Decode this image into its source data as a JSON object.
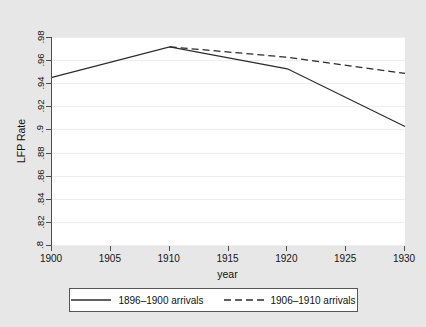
{
  "chart_data": {
    "type": "line",
    "title": "",
    "xlabel": "year",
    "ylabel": "LFP Rate",
    "xlim": [
      1900,
      1930
    ],
    "ylim": [
      0.8,
      0.98
    ],
    "grid": true,
    "legend_position": "bottom",
    "x_ticks": [
      "1900",
      "1905",
      "1910",
      "1915",
      "1920",
      "1925",
      "1930"
    ],
    "x_tick_values": [
      1900,
      1905,
      1910,
      1915,
      1920,
      1925,
      1930
    ],
    "y_ticks": [
      ".8",
      ".82",
      ".84",
      ".86",
      ".88",
      ".9",
      ".92",
      ".94",
      ".96",
      ".98"
    ],
    "y_tick_values": [
      0.8,
      0.82,
      0.84,
      0.86,
      0.88,
      0.9,
      0.92,
      0.94,
      0.96,
      0.98
    ],
    "series": [
      {
        "name": "1896–1900 arrivals",
        "style": "solid",
        "color": "#2b2b2b",
        "x": [
          1900,
          1910,
          1920,
          1930
        ],
        "values": [
          0.945,
          0.9715,
          0.9525,
          0.9025
        ]
      },
      {
        "name": "1906–1910 arrivals",
        "style": "dashed",
        "color": "#2b2b2b",
        "x": [
          1910,
          1920,
          1930
        ],
        "values": [
          0.9715,
          0.9625,
          0.9485
        ]
      }
    ]
  },
  "legend": {
    "entries": [
      {
        "label": "1896–1900 arrivals",
        "style": "solid"
      },
      {
        "label": "1906–1910 arrivals",
        "style": "dashed"
      }
    ]
  },
  "colors": {
    "figure_background": "#e7e7e7",
    "plot_background": "#ffffff",
    "axis": "#4d4d4d",
    "gridline": "#eceff1",
    "line": "#2b2b2b",
    "text": "#111111"
  }
}
